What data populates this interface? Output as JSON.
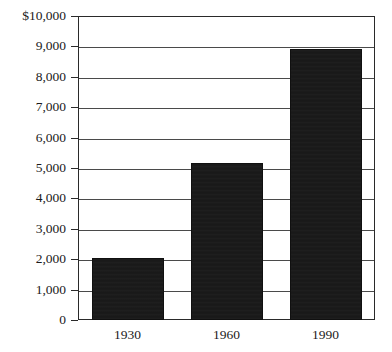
{
  "chart_data": {
    "type": "bar",
    "title": "",
    "subtitle": "",
    "xlabel": "",
    "ylabel": "",
    "categories": [
      "1930",
      "1960",
      "1990"
    ],
    "values": [
      2050,
      5150,
      8900
    ],
    "series": [
      {
        "name": "",
        "values": [
          2050,
          5150,
          8900
        ]
      }
    ],
    "ylim": [
      0,
      10000
    ],
    "ytick_values": [
      0,
      1000,
      2000,
      3000,
      4000,
      5000,
      6000,
      7000,
      8000,
      9000,
      10000
    ],
    "ytick_labels": [
      "0",
      "1,000",
      "2,000",
      "3,000",
      "4,000",
      "5,000",
      "6,000",
      "7,000",
      "8,000",
      "9,000",
      "$10,000"
    ],
    "grid": "horizontal",
    "legend": "none",
    "annotations": [],
    "bar_color": "#181818",
    "grid_color": "#4a4a4a",
    "frame_color": "#2a2a2a",
    "background_color": "#ffffff"
  }
}
